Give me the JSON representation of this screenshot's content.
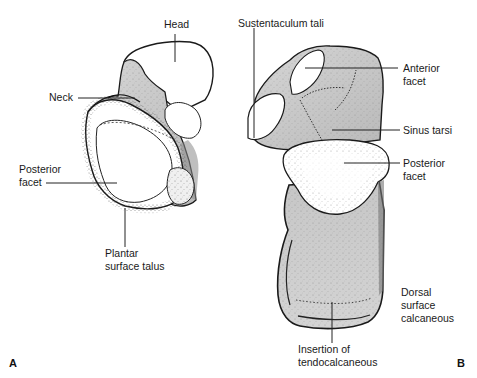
{
  "figure": {
    "colors": {
      "background": "#ffffff",
      "outline": "#1a1a1a",
      "shading_gray": "#c8c8c8",
      "dark_shading": "#8a8a8a",
      "facet_white": "#ffffff",
      "leader_line": "#222222"
    },
    "panels": [
      {
        "id": "A",
        "letter": "A",
        "subject": "talus",
        "labels": {
          "head": "Head",
          "neck": "Neck",
          "posterior_facet_line1": "Posterior",
          "posterior_facet_line2": "facet",
          "plantar_line1": "Plantar",
          "plantar_line2": "surface talus"
        }
      },
      {
        "id": "B",
        "letter": "B",
        "subject": "calcaneus",
        "labels": {
          "sustentaculum": "Sustentaculum tali",
          "anterior_facet_line1": "Anterior",
          "anterior_facet_line2": "facet",
          "sinus_tarsi": "Sinus tarsi",
          "posterior_facet_line1": "Posterior",
          "posterior_facet_line2": "facet",
          "dorsal_line1": "Dorsal",
          "dorsal_line2": "surface",
          "dorsal_line3": "calcaneous",
          "insertion_line1": "Insertion of",
          "insertion_line2": "tendocalcaneous"
        }
      }
    ]
  }
}
